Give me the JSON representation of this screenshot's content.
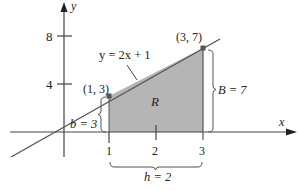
{
  "diagram": {
    "type": "region-under-line",
    "axes": {
      "x_label": "x",
      "y_label": "y",
      "y_ticks": [
        "8",
        "4"
      ],
      "x_ticks": [
        "1",
        "2",
        "3"
      ]
    },
    "line": {
      "equation": "y = 2x + 1",
      "color": "#555555"
    },
    "points": [
      {
        "label": "(1, 3)",
        "x": 1,
        "y": 3
      },
      {
        "label": "(3, 7)",
        "x": 3,
        "y": 7
      }
    ],
    "region": {
      "label": "R",
      "fill": "#b5b5b5"
    },
    "dimensions": {
      "b": "b = 3",
      "B": "B = 7",
      "h": "h = 2"
    }
  }
}
